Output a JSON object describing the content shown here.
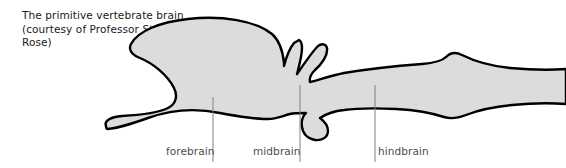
{
  "figure": {
    "width": 566,
    "height": 168,
    "background_color": "#ffffff"
  },
  "caption": {
    "text": "The primitive vertebrate brain\n(courtesy of Professor Steven\nRose)",
    "color": "#1a1a1a"
  },
  "diagram": {
    "name": "primitive-vertebrate-brain-outline",
    "fill_color": "#dcdcdc",
    "stroke_color": "#000000",
    "stroke_width": 2.4,
    "orientation": "lateral view, anterior at left, spinal cord at right",
    "features": [
      "olfactory tract extending anteriorly at lower left",
      "large rounded forebrain lobe",
      "two small dorsal stalked protrusions (pineal / parietal organs) above the midbrain",
      "ventral pituitary lobe below the midbrain",
      "elongated hindbrain with dorsal step notch",
      "spinal cord tapering off the right edge"
    ]
  },
  "labels": [
    {
      "id": "forebrain",
      "text": "forebrain",
      "color": "#4d4d4d",
      "leader_line": {
        "x": 213,
        "y_top": 97,
        "y_bottom": 162
      }
    },
    {
      "id": "midbrain",
      "text": "midbrain",
      "color": "#4d4d4d",
      "leader_line": {
        "x": 300,
        "y_top": 85,
        "y_bottom": 162
      }
    },
    {
      "id": "hindbrain",
      "text": "hindbrain",
      "color": "#4d4d4d",
      "leader_line": {
        "x": 375,
        "y_top": 85,
        "y_bottom": 162
      }
    }
  ],
  "leader_line_color": "#808080"
}
